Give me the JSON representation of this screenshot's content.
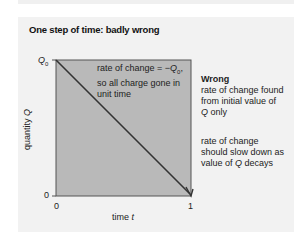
{
  "title": "One step of time: badly wrong",
  "axes": {
    "y_label": "quantity Q",
    "y_top": "Q0",
    "y_bottom": "0",
    "x_left": "0",
    "x_right": "1",
    "x_label": "time t"
  },
  "plot_annotation": [
    "rate of change = −Q0,",
    "so all charge gone in",
    "unit time"
  ],
  "side": {
    "heading": "Wrong",
    "note1": [
      "rate of change found",
      "from initial value of",
      "Q only"
    ],
    "note2": [
      "rate of change",
      "should slow down as",
      "value of Q decays"
    ]
  },
  "colors": {
    "plot_fill": "#b8b8b8",
    "panel": "#f2f2f2",
    "line": "#333333"
  }
}
